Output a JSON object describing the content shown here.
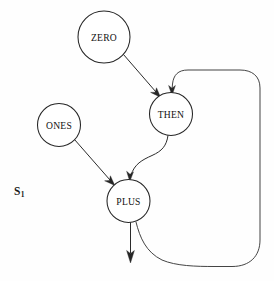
{
  "diagram": {
    "type": "dataflow-graph",
    "title": "",
    "background_color": "#fefefe",
    "stroke_color": "#262626",
    "node_fill": "#ffffff",
    "width": 274,
    "height": 281,
    "state_label": {
      "base": "S",
      "subscript": "1",
      "full": "S1",
      "x": 14,
      "y": 186
    },
    "nodes": [
      {
        "id": "zero",
        "label": "ZERO",
        "cx": 104,
        "cy": 37,
        "r": 26
      },
      {
        "id": "ones",
        "label": "ONES",
        "cx": 59,
        "cy": 125,
        "r": 21.5
      },
      {
        "id": "then",
        "label": "THEN",
        "cx": 171,
        "cy": 114,
        "r": 21.5
      },
      {
        "id": "plus",
        "label": "PLUS",
        "cx": 128.5,
        "cy": 201,
        "r": 21.5
      }
    ],
    "edges": [
      {
        "id": "zero-to-then",
        "from": "zero",
        "to": "then",
        "kind": "straight",
        "has_arrow": true
      },
      {
        "id": "ones-to-plus",
        "from": "ones",
        "to": "plus",
        "kind": "straight",
        "has_arrow": true
      },
      {
        "id": "then-to-plus",
        "from": "then",
        "to": "plus",
        "kind": "s-curve",
        "has_arrow": true
      },
      {
        "id": "plus-output",
        "from": "plus",
        "to": "output",
        "kind": "straight-down",
        "has_arrow": true
      },
      {
        "id": "plus-feedback-to-then",
        "from": "plus",
        "to": "then",
        "kind": "feedback-loop",
        "has_arrow": true
      }
    ]
  }
}
